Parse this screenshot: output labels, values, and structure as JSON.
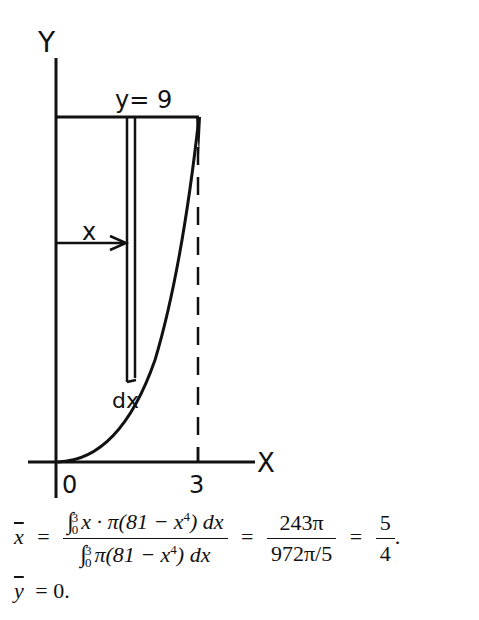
{
  "figure": {
    "axis_labels": {
      "y": "Y",
      "x": "X"
    },
    "top_line_label": "y= 9",
    "strip_distance_label": "x",
    "strip_width_label": "dx",
    "tick_labels": {
      "origin": "0",
      "x_end": "3"
    },
    "stroke_color": "#111111"
  },
  "equations": {
    "xbar": {
      "lhs": "x",
      "numerator": {
        "integral": "∫",
        "upper": "3",
        "lower": "0",
        "integrand": "x · π(81 − x",
        "power": "4",
        "tail": ") dx"
      },
      "denominator": {
        "integral": "∫",
        "upper": "3",
        "lower": "0",
        "integrand": "π(81 − x",
        "power": "4",
        "tail": ") dx"
      },
      "eq": "=",
      "mid_numerator": "243π",
      "mid_denominator": "972π/5",
      "result_numerator": "5",
      "result_denominator": "4",
      "end": "."
    },
    "ybar": {
      "lhs": "y",
      "rhs": "= 0."
    }
  }
}
